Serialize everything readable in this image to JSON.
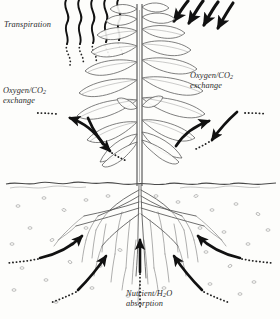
{
  "figure": {
    "background_color": "#fdfdfb",
    "ink_color": "#1a1a1a",
    "line_color": "#4a4a4a"
  },
  "labels": {
    "transpiration": "Transpiration",
    "oxygen_co2_left_line1": "Oxygen/CO",
    "oxygen_co2_left_sub": "2",
    "oxygen_co2_left_line2": "exchange",
    "oxygen_co2_right_line1": "Oxygen/CO",
    "oxygen_co2_right_sub": "2",
    "oxygen_co2_right_line2": "exchange",
    "nutrient_line1_a": "Nutrient/H",
    "nutrient_line1_sub": "2",
    "nutrient_line1_b": "O",
    "nutrient_line2": "absorption"
  },
  "diagram_parts": {
    "plant": "upright stem with opposite elliptical leaf pairs",
    "soil_line": "irregular wavy horizontal ground line",
    "roots": "fibrous branching root system below ground",
    "transpiration_streams": "wavy vapour lines rising from upper leaves",
    "sunlight_arrows": "four thick curved arrows angled down-left",
    "exchange_arrows": "curved arrows to and from lower leaves",
    "absorption_arrows": "five arrows converging on the root mass"
  }
}
